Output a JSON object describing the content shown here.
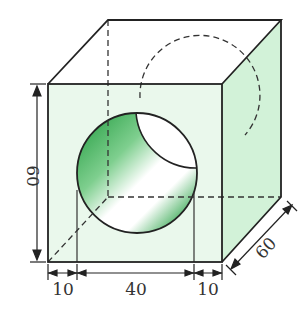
{
  "figure": {
    "colors": {
      "face_front": "#eaf8ec",
      "face_side": "#d2f2d8",
      "face_top": "#ffffff",
      "hole_dark": "#1e9a3c",
      "hole_light": "#ffffff",
      "edge": "#222222"
    }
  },
  "dimensions": {
    "height": "60",
    "depth": "60",
    "bottom_left": "10",
    "bottom_middle": "40",
    "bottom_right": "10"
  }
}
